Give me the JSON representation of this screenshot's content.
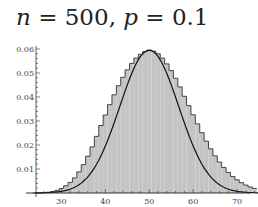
{
  "title": {
    "n_symbol": "n",
    "n_value": "500",
    "p_symbol": "p",
    "p_value": "0.1",
    "text": "n = 500, p = 0.1"
  },
  "chart_data": {
    "type": "bar",
    "title": "n = 500, p = 0.1",
    "xlabel": "",
    "ylabel": "",
    "xlim": [
      24,
      75
    ],
    "ylim": [
      0,
      0.06
    ],
    "x_ticks": [
      30,
      40,
      50,
      60,
      70
    ],
    "y_ticks": [
      0.01,
      0.02,
      0.03,
      0.04,
      0.05,
      0.06
    ],
    "y_tick_labels": [
      "0.01",
      "0.02",
      "0.03",
      "0.04",
      "0.05",
      "0.06"
    ],
    "x_tick_labels": [
      "30",
      "40",
      "50",
      "60",
      "70"
    ],
    "grid": false,
    "legend": null,
    "series": [
      {
        "name": "Binomial pmf",
        "x": [
          24,
          25,
          26,
          27,
          28,
          29,
          30,
          31,
          32,
          33,
          34,
          35,
          36,
          37,
          38,
          39,
          40,
          41,
          42,
          43,
          44,
          45,
          46,
          47,
          48,
          49,
          50,
          51,
          52,
          53,
          54,
          55,
          56,
          57,
          58,
          59,
          60,
          61,
          62,
          63,
          64,
          65,
          66,
          67,
          68,
          69,
          70,
          71,
          72,
          73,
          74
        ],
        "values": [
          3e-05,
          7e-05,
          0.00016,
          0.00033,
          0.0006,
          0.0011,
          0.0019,
          0.003,
          0.0044,
          0.0063,
          0.0088,
          0.0118,
          0.0153,
          0.0192,
          0.0236,
          0.0281,
          0.0325,
          0.0368,
          0.0409,
          0.0447,
          0.0482,
          0.0513,
          0.054,
          0.0562,
          0.0578,
          0.0589,
          0.0595,
          0.0591,
          0.058,
          0.0562,
          0.0538,
          0.051,
          0.0478,
          0.0442,
          0.0403,
          0.0364,
          0.0326,
          0.0288,
          0.0251,
          0.0216,
          0.0184,
          0.0155,
          0.0129,
          0.0106,
          0.0086,
          0.0069,
          0.0055,
          0.0043,
          0.0033,
          0.0025,
          0.0019
        ]
      },
      {
        "name": "Normal approximation",
        "type": "line",
        "mean": 50,
        "sd": 6.708
      }
    ]
  },
  "colors": {
    "bar_fill": "#c4c4c4",
    "bar_edge": "#333333",
    "curve": "#111111",
    "axis": "#333333"
  }
}
